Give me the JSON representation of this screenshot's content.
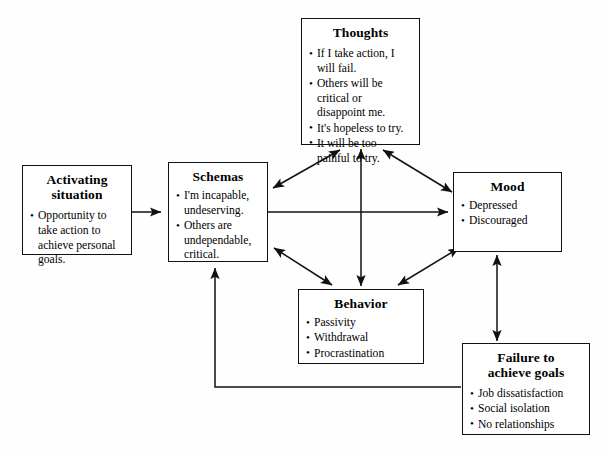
{
  "diagram": {
    "background_color": "#fefefe",
    "line_color": "#111111",
    "nodes": [
      {
        "id": "activating",
        "title": "Activating\nsituation",
        "title_line1": "Activating",
        "title_line2": "situation",
        "items": [
          "Opportunity to take action to achieve personal goals."
        ]
      },
      {
        "id": "schemas",
        "title": "Schemas",
        "items": [
          "I'm incapable, undeserving.",
          "Others are undependable, critical."
        ]
      },
      {
        "id": "thoughts",
        "title": "Thoughts",
        "items": [
          "If I take action, I will fail.",
          "Others will be critical or disappoint me.",
          "It's hopeless to try.",
          "It will be too painful to try."
        ]
      },
      {
        "id": "mood",
        "title": "Mood",
        "items": [
          "Depressed",
          "Discouraged"
        ]
      },
      {
        "id": "behavior",
        "title": "Behavior",
        "items": [
          "Passivity",
          "Withdrawal",
          "Procrastination"
        ]
      },
      {
        "id": "failure",
        "title": "Failure to\nachieve goals",
        "title_line1": "Failure to",
        "title_line2": "achieve goals",
        "items": [
          "Job dissatisfaction",
          "Social isolation",
          "No relationships"
        ]
      }
    ],
    "connections": [
      {
        "from": "activating",
        "to": "schemas",
        "style": "single-arrow",
        "path": "132,212 163,212"
      },
      {
        "from": "schemas",
        "to": "mood",
        "style": "single-arrow",
        "path": "268,212 448,212"
      },
      {
        "from": "schemas",
        "to": "thoughts",
        "style": "double-arrow",
        "path": "275,185 338,148"
      },
      {
        "from": "thoughts",
        "to": "mood",
        "style": "double-arrow",
        "path": "383,148 455,192"
      },
      {
        "from": "schemas",
        "to": "behavior",
        "style": "double-arrow",
        "path": "276,248 330,286"
      },
      {
        "from": "behavior",
        "to": "mood",
        "style": "double-arrow",
        "path": "400,286 460,248"
      },
      {
        "from": "behavior",
        "to": "thoughts",
        "style": "double-arrow",
        "path": "361,285 361,150"
      },
      {
        "from": "mood",
        "to": "failure",
        "style": "double-arrow",
        "path": "497,256 497,340"
      },
      {
        "from": "failure",
        "to": "schemas",
        "style": "single-arrow",
        "path": "460,387 215,387 215,267"
      }
    ]
  }
}
